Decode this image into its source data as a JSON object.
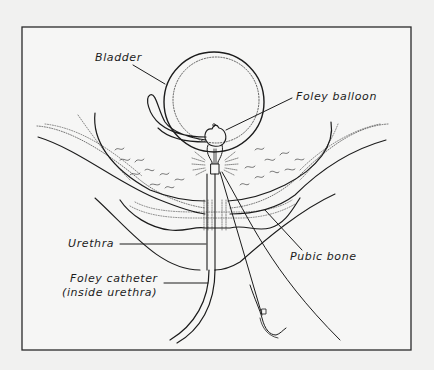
{
  "diagram": {
    "type": "anatomical-illustration",
    "colors": {
      "background": "#f1f1f0",
      "ink": "#1c1c1c",
      "frame": "#2a2a2a"
    },
    "labels": {
      "bladder": "Bladder",
      "foley_balloon": "Foley balloon",
      "urethra": "Urethra",
      "pubic_bone": "Pubic bone",
      "foley_catheter_line1": "Foley catheter",
      "foley_catheter_line2": "(inside urethra)"
    }
  }
}
